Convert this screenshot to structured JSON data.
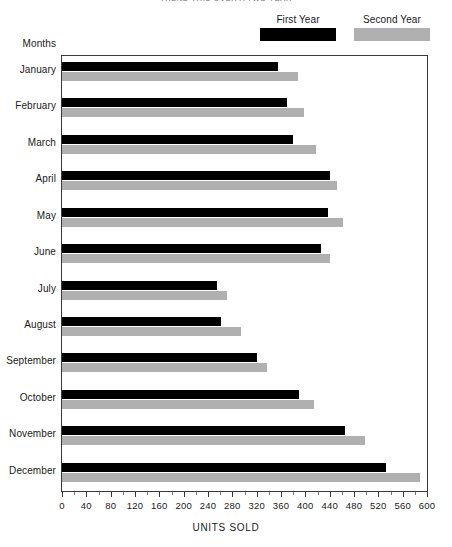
{
  "chart_data": {
    "type": "bar",
    "orientation": "horizontal",
    "title": "TREND THIS OVER A TWO YEAR",
    "xlabel": "UNITS SOLD",
    "ylabel": "Months",
    "xlim": [
      0,
      600
    ],
    "xticks": [
      0,
      40,
      80,
      120,
      160,
      200,
      240,
      280,
      320,
      360,
      400,
      440,
      480,
      520,
      560,
      600
    ],
    "xtick_labels": [
      "0",
      "40",
      "80",
      "120",
      "160",
      "200",
      "240",
      "280",
      "320",
      "360",
      "400",
      "440",
      "480",
      "520",
      "560",
      "600"
    ],
    "grid": false,
    "legend_position": "top-right",
    "categories": [
      "January",
      "February",
      "March",
      "April",
      "May",
      "June",
      "July",
      "August",
      "September",
      "October",
      "November",
      "December"
    ],
    "series": [
      {
        "name": "First Year",
        "color": "#000000",
        "values": [
          355,
          370,
          380,
          440,
          437,
          425,
          255,
          262,
          320,
          390,
          465,
          532
        ]
      },
      {
        "name": "Second Year",
        "color": "#b0b0b0",
        "values": [
          388,
          398,
          418,
          452,
          462,
          440,
          272,
          295,
          337,
          415,
          498,
          588
        ]
      }
    ]
  },
  "legend": {
    "items": [
      {
        "label": "First Year",
        "color": "#000000"
      },
      {
        "label": "Second Year",
        "color": "#b0b0b0"
      }
    ]
  },
  "colors": {
    "first_year": "#000000",
    "second_year": "#b0b0b0",
    "axis": "#3a3a3a",
    "background": "#ffffff",
    "text": "#1a1a1a"
  }
}
